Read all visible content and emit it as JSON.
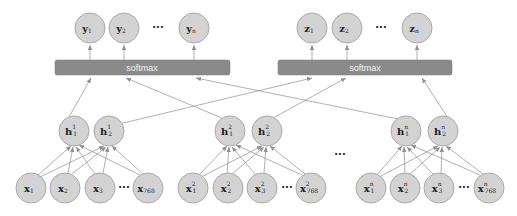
{
  "diagram": {
    "colors": {
      "node_fill": "#d3d3d3",
      "node_stroke": "#a9a9a9",
      "bar_fill": "#8a8a8a",
      "edge": "#8f8f8f"
    },
    "output_groups": [
      {
        "id": "y",
        "nodes": [
          {
            "base": "y",
            "sub": "1"
          },
          {
            "base": "y",
            "sub": "2"
          },
          {
            "base": "y",
            "sub": "n"
          }
        ],
        "ellipsis": "···",
        "softmax_label": "softmax"
      },
      {
        "id": "z",
        "nodes": [
          {
            "base": "z",
            "sub": "1"
          },
          {
            "base": "z",
            "sub": "2"
          },
          {
            "base": "z",
            "sub": "n"
          }
        ],
        "ellipsis": "···",
        "softmax_label": "softmax"
      }
    ],
    "hidden_groups": [
      {
        "nodes": [
          {
            "base": "h",
            "sub": "1",
            "sup": "1"
          },
          {
            "base": "h",
            "sub": "2",
            "sup": "1"
          }
        ]
      },
      {
        "nodes": [
          {
            "base": "h",
            "sub": "1",
            "sup": "2"
          },
          {
            "base": "h",
            "sub": "2",
            "sup": "2"
          }
        ]
      },
      {
        "nodes": [
          {
            "base": "h",
            "sub": "1",
            "sup": "n"
          },
          {
            "base": "h",
            "sub": "2",
            "sup": "n"
          }
        ]
      }
    ],
    "input_groups": [
      {
        "nodes": [
          {
            "base": "x",
            "sub": "1",
            "sup": ""
          },
          {
            "base": "x",
            "sub": "2",
            "sup": ""
          },
          {
            "base": "x",
            "sub": "3",
            "sup": ""
          },
          {
            "base": "x",
            "sub": "768",
            "sup": ""
          }
        ],
        "ellipsis": "···"
      },
      {
        "nodes": [
          {
            "base": "x",
            "sub": "1",
            "sup": "2"
          },
          {
            "base": "x",
            "sub": "2",
            "sup": "2"
          },
          {
            "base": "x",
            "sub": "3",
            "sup": "2"
          },
          {
            "base": "x",
            "sub": "768",
            "sup": "2"
          }
        ],
        "ellipsis": "···"
      },
      {
        "nodes": [
          {
            "base": "x",
            "sub": "1",
            "sup": "n"
          },
          {
            "base": "x",
            "sub": "2",
            "sup": "n"
          },
          {
            "base": "x",
            "sub": "3",
            "sup": "n"
          },
          {
            "base": "x",
            "sub": "768",
            "sup": "n"
          }
        ],
        "ellipsis": "···"
      }
    ],
    "group_ellipsis": "···"
  }
}
